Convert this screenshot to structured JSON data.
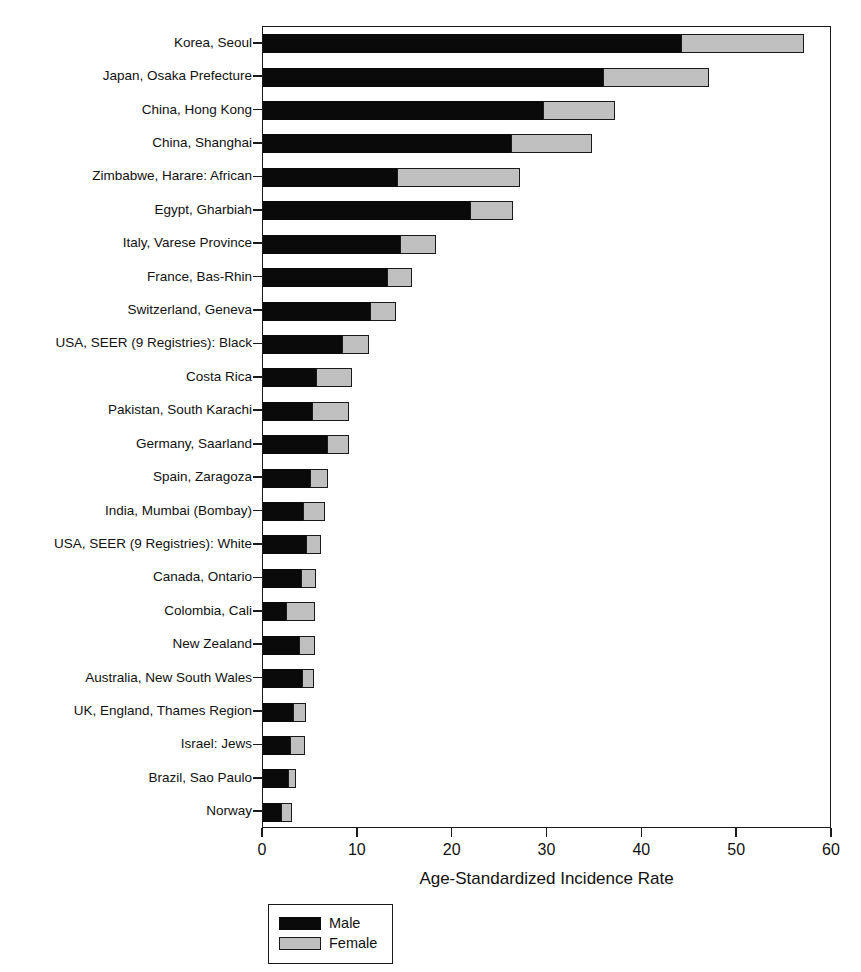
{
  "chart_data": {
    "type": "bar",
    "orientation": "horizontal",
    "stacked": true,
    "title": "",
    "xlabel": "Age-Standardized Incidence Rate",
    "ylabel": "",
    "xlim": [
      0,
      60
    ],
    "xticks": [
      0,
      10,
      20,
      30,
      40,
      50,
      60
    ],
    "xticklabels": [
      "0",
      "10",
      "20",
      "30",
      "40",
      "50",
      "60"
    ],
    "grid": false,
    "legend_position": "below-axis-left",
    "categories": [
      "Korea, Seoul",
      "Japan, Osaka Prefecture",
      "China, Hong Kong",
      "China, Shanghai",
      "Zimbabwe, Harare: African",
      "Egypt, Gharbiah",
      "Italy, Varese Province",
      "France, Bas-Rhin",
      "Switzerland, Geneva",
      "USA, SEER (9 Registries): Black",
      "Costa Rica",
      "Pakistan, South Karachi",
      "Germany, Saarland",
      "Spain, Zaragoza",
      "India, Mumbai (Bombay)",
      "USA, SEER (9 Registries): White",
      "Canada, Ontario",
      "Colombia, Cali",
      "New Zealand",
      "Australia, New South Wales",
      "UK, England, Thames Region",
      "Israel: Jews",
      "Brazil, Sao Paulo",
      "Norway"
    ],
    "series": [
      {
        "name": "Male",
        "color": "#0a0a0a",
        "values": [
          44.1,
          35.8,
          29.5,
          26.2,
          14.1,
          21.8,
          14.4,
          13.1,
          11.3,
          8.3,
          5.6,
          5.2,
          6.8,
          5.0,
          4.2,
          4.5,
          4.0,
          2.4,
          3.8,
          4.1,
          3.2,
          2.8,
          2.6,
          1.9
        ]
      },
      {
        "name": "Female",
        "color": "#c0c0c0",
        "values": [
          12.9,
          11.2,
          7.6,
          8.5,
          13.0,
          4.6,
          3.8,
          2.6,
          2.7,
          2.9,
          3.8,
          3.9,
          2.3,
          1.9,
          2.3,
          1.6,
          1.6,
          3.1,
          1.7,
          1.3,
          1.3,
          1.6,
          0.9,
          1.2
        ]
      }
    ],
    "totals": [
      57.0,
      47.0,
      37.1,
      34.7,
      27.1,
      26.4,
      18.2,
      15.7,
      14.0,
      11.2,
      9.4,
      9.1,
      9.1,
      6.9,
      6.5,
      6.1,
      5.6,
      5.5,
      5.5,
      5.4,
      4.5,
      4.4,
      3.5,
      3.1
    ]
  },
  "legend": {
    "items": [
      {
        "label": "Male",
        "color": "#0a0a0a"
      },
      {
        "label": "Female",
        "color": "#c0c0c0"
      }
    ]
  }
}
